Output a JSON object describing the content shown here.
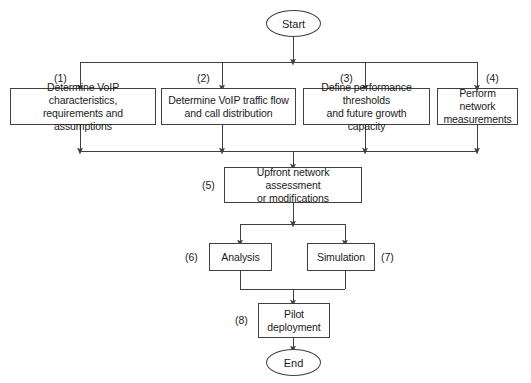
{
  "diagram": {
    "background_color": "#ffffff",
    "line_color": "#404040",
    "text_color": "#1a1a1a"
  },
  "terminals": {
    "start": "Start",
    "end": "End"
  },
  "steps": [
    {
      "number": "(1)",
      "label": "Determine VoIP characteristics,\nrequirements and assumptions"
    },
    {
      "number": "(2)",
      "label": "Determine VoIP traffic flow\nand call distribution"
    },
    {
      "number": "(3)",
      "label": "Define performance thresholds\nand future growth capacity"
    },
    {
      "number": "(4)",
      "label": "Perform network\nmeasurements"
    },
    {
      "number": "(5)",
      "label": "Upfront network assessment\nor modifications"
    },
    {
      "number": "(6)",
      "label": "Analysis"
    },
    {
      "number": "(7)",
      "label": "Simulation"
    },
    {
      "number": "(8)",
      "label": "Pilot\ndeployment"
    }
  ]
}
